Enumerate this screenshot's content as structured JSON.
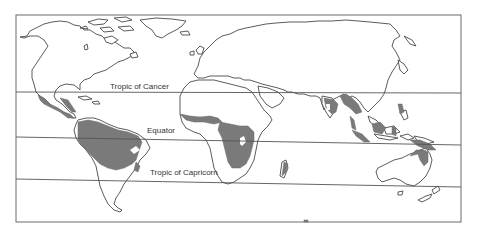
{
  "map": {
    "title": "",
    "type": "world-map",
    "subject": "Tropical rainforest distribution",
    "colors": {
      "land_outline": "#4a4a4a",
      "forest_fill": "#7a7a7a",
      "background": "#ffffff",
      "frame": "#6a6a6a"
    },
    "lines": [
      {
        "name": "Tropic of Cancer",
        "label": "Tropic of Cancer"
      },
      {
        "name": "Equator",
        "label": "Equator"
      },
      {
        "name": "Tropic of Capricorn",
        "label": "Tropic of Capricorn"
      }
    ],
    "shaded_regions": [
      "Central America",
      "Amazon Basin",
      "West Africa",
      "Congo Basin",
      "Madagascar",
      "India Western Ghats",
      "Southeast Asia",
      "Indonesia",
      "Philippines",
      "New Guinea",
      "Northern Australia"
    ]
  }
}
